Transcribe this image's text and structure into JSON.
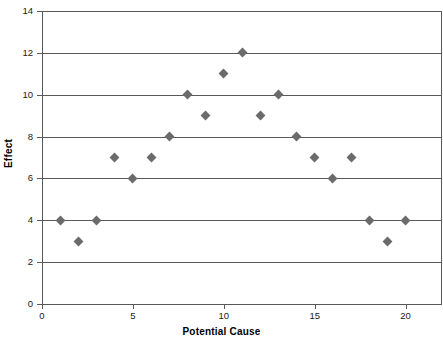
{
  "chart_data": {
    "type": "scatter",
    "title": "",
    "xlabel": "Potential Cause",
    "ylabel": "Effect",
    "xlim": [
      0,
      22
    ],
    "ylim": [
      0,
      14
    ],
    "grid": true,
    "legend": false,
    "marker": "diamond",
    "marker_color": "#6b6b6b",
    "axis_color": "#595959",
    "x_ticks": [
      0,
      5,
      10,
      15,
      20
    ],
    "y_ticks": [
      0,
      2,
      4,
      6,
      8,
      10,
      12,
      14
    ],
    "x": [
      1,
      2,
      3,
      4,
      5,
      6,
      7,
      8,
      9,
      10,
      11,
      12,
      13,
      14,
      15,
      16,
      17,
      18,
      19,
      20
    ],
    "y": [
      4,
      3,
      4,
      7,
      6,
      7,
      8,
      10,
      9,
      11,
      12,
      9,
      10,
      8,
      7,
      6,
      7,
      4,
      3,
      4
    ],
    "points": [
      {
        "x": 1,
        "y": 4
      },
      {
        "x": 2,
        "y": 3
      },
      {
        "x": 3,
        "y": 4
      },
      {
        "x": 4,
        "y": 7
      },
      {
        "x": 5,
        "y": 6
      },
      {
        "x": 6,
        "y": 7
      },
      {
        "x": 7,
        "y": 8
      },
      {
        "x": 8,
        "y": 10
      },
      {
        "x": 9,
        "y": 9
      },
      {
        "x": 10,
        "y": 11
      },
      {
        "x": 11,
        "y": 12
      },
      {
        "x": 12,
        "y": 9
      },
      {
        "x": 13,
        "y": 10
      },
      {
        "x": 14,
        "y": 8
      },
      {
        "x": 15,
        "y": 7
      },
      {
        "x": 16,
        "y": 6
      },
      {
        "x": 17,
        "y": 7
      },
      {
        "x": 18,
        "y": 4
      },
      {
        "x": 19,
        "y": 3
      },
      {
        "x": 20,
        "y": 4
      }
    ]
  }
}
